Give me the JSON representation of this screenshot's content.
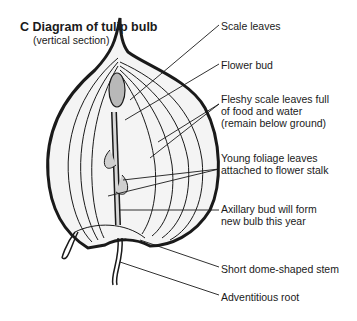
{
  "figure": {
    "letter": "C",
    "title": "C  Diagram of tulip bulb",
    "subtitle": "(vertical section)"
  },
  "labels": [
    {
      "id": "scale-leaves",
      "text": "Scale leaves"
    },
    {
      "id": "flower-bud",
      "text": "Flower bud"
    },
    {
      "id": "fleshy-scale-leaves",
      "text": "Fleshy scale leaves full\nof food and water\n(remain below ground)"
    },
    {
      "id": "young-foliage-leaves",
      "text": "Young foliage leaves\nattached to flower stalk"
    },
    {
      "id": "axillary-bud",
      "text": "Axillary bud will form\nnew bulb this year"
    },
    {
      "id": "stem",
      "text": "Short dome-shaped stem"
    },
    {
      "id": "adventitious-root",
      "text": "Adventitious root"
    }
  ],
  "colors": {
    "line": "#1a1a1a",
    "fill_light": "#ececec",
    "fill_bud": "#b8b8b8"
  }
}
